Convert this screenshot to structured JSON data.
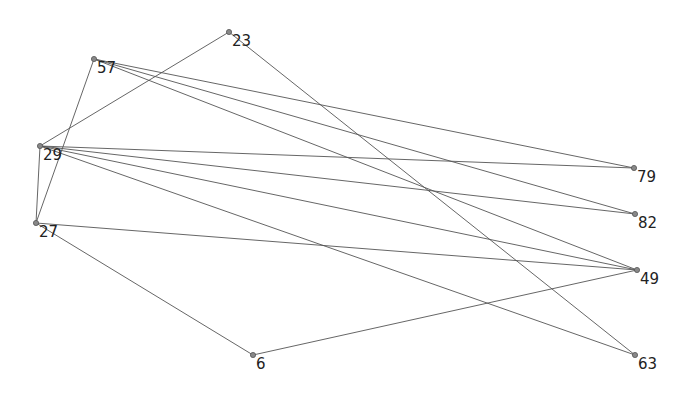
{
  "diagram": {
    "type": "network-graph",
    "width": 688,
    "height": 398,
    "colors": {
      "background": "#ffffff",
      "edge": "#555555",
      "node_fill": "#888888",
      "label": "#222222"
    },
    "nodes": [
      {
        "id": "23",
        "label": "23",
        "x": 229,
        "y": 32
      },
      {
        "id": "57",
        "label": "57",
        "x": 94,
        "y": 59
      },
      {
        "id": "29",
        "label": "29",
        "x": 40,
        "y": 146
      },
      {
        "id": "27",
        "label": "27",
        "x": 36,
        "y": 223
      },
      {
        "id": "6",
        "label": "6",
        "x": 253,
        "y": 355
      },
      {
        "id": "79",
        "label": "79",
        "x": 634,
        "y": 168
      },
      {
        "id": "82",
        "label": "82",
        "x": 635,
        "y": 214
      },
      {
        "id": "49",
        "label": "49",
        "x": 637,
        "y": 270
      },
      {
        "id": "63",
        "label": "63",
        "x": 635,
        "y": 355
      }
    ],
    "edges": [
      {
        "source": "23",
        "target": "29"
      },
      {
        "source": "23",
        "target": "63"
      },
      {
        "source": "57",
        "target": "27"
      },
      {
        "source": "57",
        "target": "79"
      },
      {
        "source": "57",
        "target": "82"
      },
      {
        "source": "57",
        "target": "49"
      },
      {
        "source": "29",
        "target": "27"
      },
      {
        "source": "29",
        "target": "79"
      },
      {
        "source": "29",
        "target": "82"
      },
      {
        "source": "29",
        "target": "49"
      },
      {
        "source": "29",
        "target": "63"
      },
      {
        "source": "27",
        "target": "49"
      },
      {
        "source": "27",
        "target": "6"
      },
      {
        "source": "6",
        "target": "49"
      }
    ]
  }
}
